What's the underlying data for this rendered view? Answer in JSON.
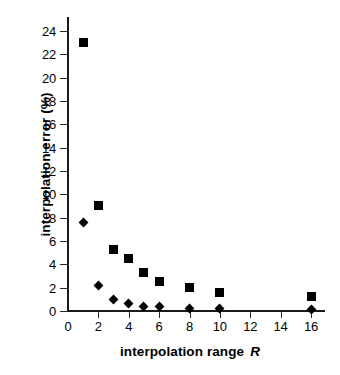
{
  "chart_data": {
    "type": "scatter",
    "title": "",
    "xlabel": "interpolation range",
    "xlabel_variable": "R",
    "ylabel": "interpolation error (%)",
    "xlim": [
      0,
      17
    ],
    "ylim": [
      0,
      25.3
    ],
    "grid": false,
    "legend": "none",
    "background_color": "#ffffff",
    "marker_color": "#000000",
    "axis_color": "#1a1a1a",
    "x_ticks": [
      0,
      2,
      4,
      6,
      8,
      10,
      12,
      14,
      16
    ],
    "x_tick_labels": [
      "0",
      "2",
      "4",
      "6",
      "8",
      "10",
      "12",
      "14",
      "16"
    ],
    "y_ticks": [
      0,
      2,
      4,
      6,
      8,
      10,
      12,
      14,
      16,
      18,
      20,
      22,
      24
    ],
    "y_tick_labels": [
      "0",
      "2",
      "4",
      "6",
      "8",
      "10",
      "12",
      "14",
      "16",
      "18",
      "20",
      "22",
      "24"
    ],
    "x": [
      1,
      2,
      3,
      4,
      5,
      6,
      8,
      10,
      16
    ],
    "series": [
      {
        "name": "square-series",
        "marker": "square",
        "values": [
          23.0,
          9.0,
          5.3,
          4.5,
          3.3,
          2.5,
          2.0,
          1.6,
          1.2
        ]
      },
      {
        "name": "diamond-series",
        "marker": "diamond",
        "values": [
          7.6,
          2.2,
          1.0,
          0.65,
          0.4,
          0.35,
          0.25,
          0.2,
          0.15
        ]
      }
    ]
  }
}
